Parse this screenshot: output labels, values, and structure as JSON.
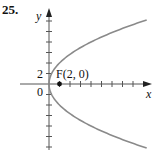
{
  "problem_number": "25.",
  "chart_data": {
    "type": "line",
    "title": "",
    "equation": "y^2 = 8x",
    "xlabel": "x",
    "ylabel": "y",
    "tick_step": 2,
    "y_tick_label": "2",
    "origin_label": "0",
    "focus": {
      "label": "F(2, 0)",
      "x": 2,
      "y": 0
    },
    "xlim": [
      0,
      18
    ],
    "ylim": [
      -12,
      12
    ],
    "series": [
      {
        "name": "parabola",
        "color": "#808080",
        "x": [
          18,
          12.5,
          8,
          4.5,
          2,
          0.5,
          0,
          0.5,
          2,
          4.5,
          8,
          12.5,
          18
        ],
        "y": [
          -12,
          -10,
          -8,
          -6,
          -4,
          -2,
          0,
          2,
          4,
          6,
          8,
          10,
          12
        ]
      }
    ]
  }
}
